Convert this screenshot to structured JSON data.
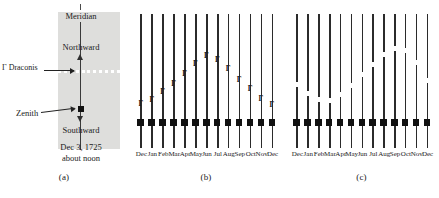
{
  "figure": {
    "panels": [
      "(a)",
      "(b)",
      "(c)"
    ]
  },
  "panel_a": {
    "caption": "(a)",
    "meridian_label": "Meridian",
    "northward_label": "Northward",
    "southward_label": "Southward",
    "star_label": "Γ Draconis",
    "zenith_label": "Zenith",
    "date_line1": "Dec 3, 1725",
    "date_line2": "about noon",
    "dot_count": 11,
    "shade_color": "#dededc",
    "marker_color": "#111111"
  },
  "panel_b": {
    "caption": "(b)",
    "marker_glyph": "Γ"
  },
  "panel_c": {
    "caption": "(c)",
    "marker_glyph": ""
  },
  "chart_data": [
    {
      "type": "scatter",
      "title": "(b)",
      "xlabel": "",
      "ylabel": "",
      "categories": [
        "Dec",
        "Jan",
        "Feb",
        "Mar",
        "Apr",
        "May",
        "Jun",
        "Jul",
        "Aug",
        "Sep",
        "Oct",
        "Nov",
        "Dec"
      ],
      "series": [
        {
          "name": "gamma Draconis apparent position",
          "marker": "gamma-glyph-filled",
          "values": [
            22,
            26,
            34,
            42,
            52,
            62,
            70,
            66,
            57,
            46,
            37,
            27,
            21
          ],
          "note": "height above zenith line, arbitrary units; annual arc peaking near June"
        },
        {
          "name": "Zenith reference",
          "marker": "filled-square",
          "values": [
            0,
            0,
            0,
            0,
            0,
            0,
            0,
            0,
            0,
            0,
            0,
            0,
            0
          ]
        }
      ],
      "ylim": [
        0,
        100
      ],
      "grid": false,
      "legend": "none"
    },
    {
      "type": "scatter",
      "title": "(c)",
      "xlabel": "",
      "ylabel": "",
      "categories": [
        "Dec",
        "Jan",
        "Feb",
        "Mar",
        "Apr",
        "May",
        "Jun",
        "Jul",
        "Aug",
        "Sep",
        "Oct",
        "Nov",
        "Dec"
      ],
      "series": [
        {
          "name": "gamma Draconis apparent position",
          "marker": "open-square",
          "values": [
            40,
            31,
            25,
            24,
            30,
            39,
            50,
            60,
            70,
            76,
            74,
            62,
            44
          ],
          "note": "height above zenith line, arbitrary units; annual arc peaking near September/October"
        },
        {
          "name": "Zenith reference",
          "marker": "filled-square",
          "values": [
            0,
            0,
            0,
            0,
            0,
            0,
            0,
            0,
            0,
            0,
            0,
            0,
            0
          ]
        }
      ],
      "ylim": [
        0,
        100
      ],
      "grid": false,
      "legend": "none"
    }
  ]
}
